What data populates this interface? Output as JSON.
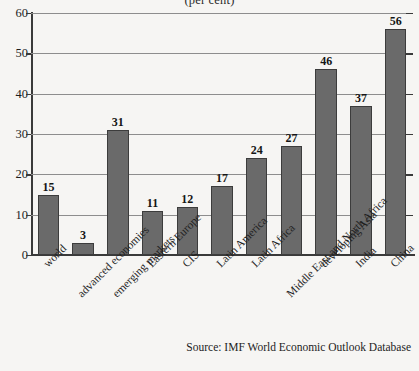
{
  "chart_data": {
    "type": "bar",
    "title": "(per cent)",
    "xlabel": "",
    "ylabel": "",
    "ylim": [
      0,
      60
    ],
    "yticks": [
      0,
      10,
      20,
      30,
      40,
      50,
      60
    ],
    "grid": true,
    "legend": false,
    "categories": [
      "world",
      "advanced economies",
      "emerging markets",
      "Eastern Europe",
      "CIS",
      "Latin America",
      "Latin Africa",
      "Middle East and North Africa",
      "developing Asia",
      "India",
      "China"
    ],
    "values": [
      15,
      3,
      31,
      11,
      12,
      17,
      24,
      27,
      46,
      37,
      56
    ],
    "bar_color": "#6a6a6a",
    "bar_edge_color": "#3c3c3c",
    "background_color": "#f6f5f3",
    "source": "Source: IMF World Economic Outlook Database"
  }
}
